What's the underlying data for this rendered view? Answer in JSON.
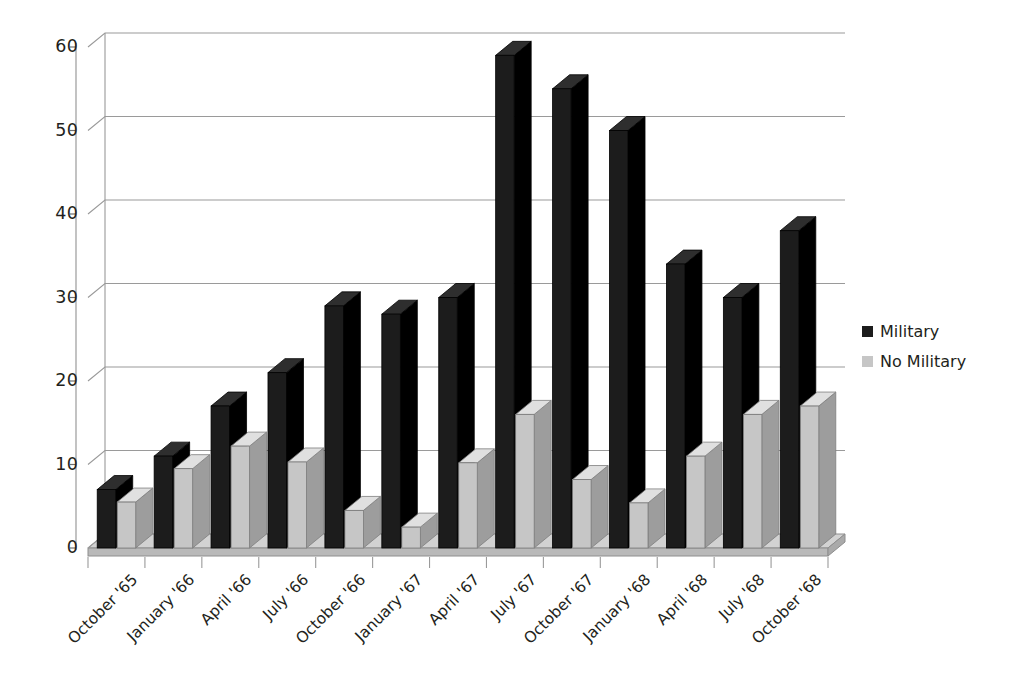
{
  "chart_data": {
    "type": "bar",
    "title": "",
    "xlabel": "",
    "ylabel": "",
    "ylim": [
      0,
      60
    ],
    "yticks": [
      0,
      10,
      20,
      30,
      40,
      50,
      60
    ],
    "grid": true,
    "legend_position": "right",
    "style": "3d-clustered-column",
    "categories": [
      "October '65",
      "January '66",
      "April '66",
      "July '66",
      "October '66",
      "January '67",
      "April '67",
      "July '67",
      "October '67",
      "January '68",
      "April '68",
      "July '68",
      "October '68"
    ],
    "series": [
      {
        "name": "Military",
        "color": "#1c1c1c",
        "values": [
          7,
          11,
          17,
          21,
          29,
          28,
          30,
          59,
          55,
          50,
          34,
          30,
          38
        ]
      },
      {
        "name": "No Military",
        "color": "#c6c6c6",
        "values": [
          5.5,
          9.5,
          12.2,
          10.3,
          4.5,
          2.5,
          10.2,
          16,
          8.2,
          5.4,
          11,
          16,
          17
        ]
      }
    ]
  },
  "legend": {
    "items": [
      {
        "label": "Military",
        "color": "#1c1c1c"
      },
      {
        "label": "No Military",
        "color": "#c6c6c6"
      }
    ]
  },
  "axis": {
    "y_tick_labels": [
      "60",
      "50",
      "40",
      "30",
      "20",
      "10",
      "0"
    ]
  },
  "colors": {
    "military": "#1c1c1c",
    "no_military": "#c6c6c6",
    "gridline": "#9a9a9a",
    "floor": "#b9b9b9",
    "floor_top": "#d2d2d2",
    "background": "#ffffff"
  }
}
